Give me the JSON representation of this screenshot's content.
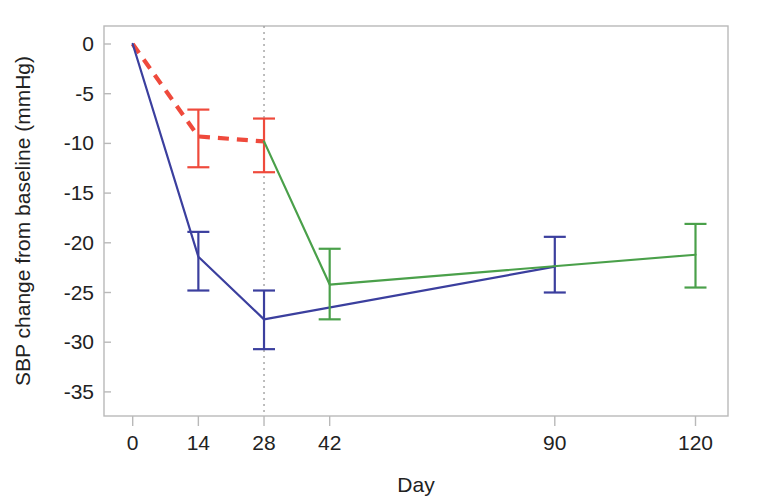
{
  "chart_data": {
    "type": "line",
    "title": "",
    "xlabel": "Day",
    "ylabel": "SBP change from baseline (mmHg)",
    "xlim": [
      -6,
      128
    ],
    "ylim": [
      -37,
      1.5
    ],
    "grid": false,
    "legend": "none",
    "x_ticks": [
      0,
      14,
      28,
      42,
      90,
      120
    ],
    "x_tick_labels": [
      "0",
      "14",
      "28",
      "42",
      "90",
      "120"
    ],
    "y_ticks": [
      0,
      -5,
      -10,
      -15,
      -20,
      -25,
      -30,
      -35
    ],
    "y_tick_labels": [
      "0",
      "-5",
      "-10",
      "-15",
      "-20",
      "-25",
      "-30",
      "-35"
    ],
    "annotations": [
      {
        "name": "vertical-reference-line",
        "type": "vline",
        "x": 28,
        "style": "dotted",
        "color": "#9a9a9a"
      }
    ],
    "series": [
      {
        "name": "series-red-dashed",
        "color": "#ef4a3c",
        "linestyle": "dashed",
        "x": [
          0,
          14,
          28
        ],
        "values": [
          0.0,
          -9.3,
          -9.8
        ],
        "err_low": [
          0.0,
          -12.4,
          -12.9
        ],
        "err_high": [
          0.0,
          -6.6,
          -7.5
        ],
        "error_bars_at": [
          14,
          28
        ]
      },
      {
        "name": "series-blue-solid",
        "color": "#3b3f9e",
        "linestyle": "solid",
        "x": [
          0,
          14,
          28,
          90
        ],
        "values": [
          0.0,
          -21.4,
          -27.7,
          -22.4
        ],
        "err_low": [
          0.0,
          -24.8,
          -30.7,
          -25.0
        ],
        "err_high": [
          0.0,
          -18.9,
          -24.8,
          -19.4
        ],
        "error_bars_at": [
          14,
          28,
          90
        ]
      },
      {
        "name": "series-green-solid",
        "color": "#4aa04a",
        "linestyle": "solid",
        "x": [
          28,
          42,
          120
        ],
        "values": [
          -9.8,
          -24.2,
          -21.2
        ],
        "err_low": [
          -9.8,
          -27.7,
          -24.5
        ],
        "err_high": [
          -9.8,
          -20.6,
          -18.1
        ],
        "error_bars_at": [
          42,
          120
        ]
      }
    ]
  },
  "colors": {
    "red": "#ef4a3c",
    "blue": "#3b3f9e",
    "green": "#4aa04a",
    "axis": "#b9b9b9",
    "text": "#222222",
    "reference_line": "#9a9a9a",
    "background": "#ffffff"
  }
}
